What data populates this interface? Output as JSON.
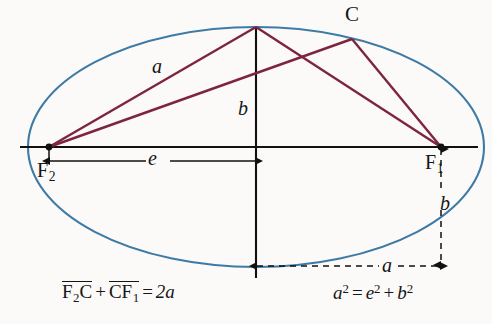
{
  "figure": {
    "type": "geometry-diagram",
    "background_color": "#fbfaf8",
    "colors": {
      "ellipse_stroke": "#3d7ba5",
      "chord_stroke": "#7d2540",
      "axis_stroke": "#111111",
      "dimension_stroke": "#111111",
      "text": "#151515"
    },
    "geometry": {
      "center": {
        "x": 256,
        "y": 147
      },
      "semi_major_px": 228,
      "semi_minor_px": 120,
      "focus_left": {
        "x": 49,
        "y": 147
      },
      "focus_right": {
        "x": 441,
        "y": 147
      },
      "top_vertex": {
        "x": 256,
        "y": 27
      },
      "bottom_vertex": {
        "x": 256,
        "y": 267
      },
      "point_c": {
        "x": 352,
        "y": 39
      },
      "horizontal_axis": {
        "x1": 20,
        "x2": 478,
        "y": 147
      },
      "vertical_axis": {
        "x": 256,
        "y1": 27,
        "y2": 278
      }
    },
    "labels": {
      "point_c": "C",
      "focus_right": "F",
      "focus_right_sub": "1",
      "focus_left": "F",
      "focus_left_sub": "2",
      "semi_major_upper": "a",
      "semi_minor_center": "b",
      "linear_eccentricity": "e",
      "semi_minor_right": "b",
      "semi_major_lower": "a"
    },
    "dimensions": [
      {
        "name": "e",
        "label": "e",
        "style": "solid",
        "orientation": "horizontal",
        "x1": 49,
        "x2": 256,
        "y": 161,
        "arrowheads": "both"
      },
      {
        "name": "a-lower",
        "label": "a",
        "style": "dashed",
        "orientation": "horizontal",
        "x1": 256,
        "x2": 441,
        "y": 266,
        "arrowheads": "both"
      },
      {
        "name": "b-right",
        "label": "b",
        "style": "dashed",
        "orientation": "vertical",
        "x": 441,
        "y1": 147,
        "y2": 266,
        "arrowheads": "both"
      }
    ],
    "chords": [
      {
        "name": "F2-to-top-vertex",
        "from": "focus_left",
        "to": "top_vertex"
      },
      {
        "name": "F2-to-C",
        "from": "focus_left",
        "to": "point_c"
      },
      {
        "name": "top-vertex-to-F1",
        "from": "top_vertex",
        "to": "focus_right"
      },
      {
        "name": "C-to-F1",
        "from": "point_c",
        "to": "focus_right"
      }
    ],
    "formulas": {
      "left": {
        "name": "focal-sum-definition",
        "term1_seg1": "F",
        "term1_sub1": "2",
        "term1_seg2": "C",
        "plus": "+",
        "term2_seg1": "CF",
        "term2_sub1": "1",
        "equals": "=",
        "result": "2a",
        "plain": "F2C + CF1 = 2a"
      },
      "right": {
        "name": "pythagorean-relation",
        "base_a": "a",
        "exp_a": "2",
        "equals": "=",
        "base_e": "e",
        "exp_e": "2",
        "plus": "+",
        "base_b": "b",
        "exp_b": "2",
        "plain": "a2 = e2 + b2"
      }
    }
  }
}
